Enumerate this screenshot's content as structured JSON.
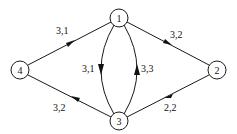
{
  "diagram": {
    "type": "directed-graph",
    "nodes": [
      {
        "id": "1",
        "label": "1",
        "x": 119,
        "y": 18
      },
      {
        "id": "2",
        "label": "2",
        "x": 217,
        "y": 70
      },
      {
        "id": "3",
        "label": "3",
        "x": 119,
        "y": 121
      },
      {
        "id": "4",
        "label": "4",
        "x": 20,
        "y": 70
      }
    ],
    "edges": [
      {
        "from": "4",
        "to": "1",
        "label": "3,1"
      },
      {
        "from": "1",
        "to": "2",
        "label": "3,2"
      },
      {
        "from": "2",
        "to": "3",
        "label": "2,2"
      },
      {
        "from": "3",
        "to": "4",
        "label": "3,2"
      },
      {
        "from": "1",
        "to": "3",
        "label": "3,1"
      },
      {
        "from": "3",
        "to": "1",
        "label": "3,3"
      }
    ]
  }
}
